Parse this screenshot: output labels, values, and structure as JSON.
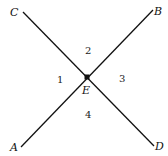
{
  "diagram": {
    "type": "intersecting-lines",
    "points": {
      "A": "A",
      "B": "B",
      "C": "C",
      "D": "D",
      "E": "E"
    },
    "angles": [
      "1",
      "2",
      "3",
      "4"
    ],
    "lines": [
      {
        "name": "line-CD",
        "from": "C",
        "to": "D",
        "through": "E"
      },
      {
        "name": "line-AB",
        "from": "A",
        "to": "B",
        "through": "E"
      }
    ],
    "colors": {
      "stroke": "#111111",
      "background": "#ffffff"
    }
  }
}
